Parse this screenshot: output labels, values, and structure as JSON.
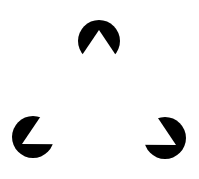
{
  "figure": {
    "background": "#ffffff",
    "inducer_color": "#000000",
    "inducers": [
      {
        "name": "top",
        "cx": 99,
        "cy": 41,
        "r": 21
      },
      {
        "name": "bottom-left",
        "cx": 33,
        "cy": 137,
        "r": 21
      },
      {
        "name": "bottom-right",
        "cx": 165,
        "cy": 138,
        "r": 21
      }
    ],
    "illusory_triangle": [
      [
        99,
        30
      ],
      [
        22,
        144
      ],
      [
        176,
        145
      ]
    ]
  }
}
